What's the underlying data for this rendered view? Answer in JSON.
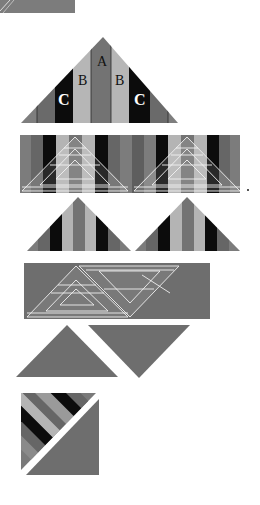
{
  "diagram": {
    "colors": {
      "background": "#ffffff",
      "mid_gray": "#7a7a7a",
      "dark_gray": "#626262",
      "black": "#0c0c0c",
      "light_gray": "#b4b4b4",
      "center_gray": "#727272",
      "ruler_line": "#f2f2f2",
      "solid_gray": "#6e6e6e"
    },
    "steps": [
      {
        "id": "step-0-partial-band",
        "description": "Partial strip band cut off at top"
      },
      {
        "id": "step-1-labeled-triangle",
        "description": "Triangle of strips labeled A, B, C",
        "labels": {
          "center": "A",
          "inner_left": "B",
          "inner_right": "B",
          "outer_left": "C",
          "outer_right": "C"
        }
      },
      {
        "id": "step-2-band-with-rulers",
        "description": "Strip band with two triangle rulers placed"
      },
      {
        "id": "step-3-cut-triangles",
        "description": "Two striped triangles cut from band"
      },
      {
        "id": "step-4-solid-band-with-rulers",
        "description": "Solid gray band with alternating triangle rulers"
      },
      {
        "id": "step-5-solid-triangles",
        "description": "Upright and inverted solid triangles"
      },
      {
        "id": "step-6-square-unit",
        "description": "Striped and solid triangles joined into a square"
      }
    ]
  }
}
